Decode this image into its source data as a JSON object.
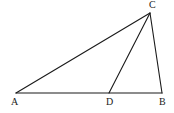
{
  "diagram": {
    "type": "triangle",
    "points": {
      "A": {
        "label": "A",
        "x": 16,
        "y": 93,
        "label_x": 11,
        "label_y": 105
      },
      "B": {
        "label": "B",
        "x": 162,
        "y": 93,
        "label_x": 159,
        "label_y": 105
      },
      "C": {
        "label": "C",
        "x": 150,
        "y": 13,
        "label_x": 149,
        "label_y": 8
      },
      "D": {
        "label": "D",
        "x": 109,
        "y": 93,
        "label_x": 106,
        "label_y": 105
      }
    },
    "segments": [
      {
        "name": "AB",
        "from": "A",
        "to": "B"
      },
      {
        "name": "AC",
        "from": "A",
        "to": "C"
      },
      {
        "name": "BC",
        "from": "B",
        "to": "C"
      },
      {
        "name": "CD",
        "from": "C",
        "to": "D"
      }
    ],
    "colors": {
      "line": "#1a1a1a",
      "label": "#222222",
      "background": "#ffffff"
    }
  }
}
